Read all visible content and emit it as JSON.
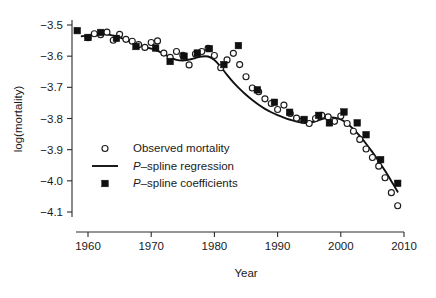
{
  "chart_data": {
    "type": "scatter",
    "title": "",
    "xlabel": "Year",
    "ylabel": "log(mortality)",
    "xlim": [
      1957.5,
      2010.5
    ],
    "ylim": [
      -4.16,
      -3.47
    ],
    "grid": false,
    "legend_position": "inside-left-lower",
    "xticks": [
      1960,
      1970,
      1980,
      1990,
      2000,
      2010
    ],
    "xticklabels": [
      "1960",
      "1970",
      "1980",
      "1990",
      "2000",
      "2010"
    ],
    "yticks": [
      -3.5,
      -3.6,
      -3.7,
      -3.8,
      -3.9,
      -4.0,
      -4.1
    ],
    "yticklabels": [
      "-3.5",
      "-3.6",
      "-3.7",
      "-3.8",
      "-3.9",
      "-4.0",
      "-4.1"
    ],
    "series": [
      {
        "name": "Observed mortality",
        "marker": "open-circle",
        "x": [
          1960,
          1961,
          1962,
          1963,
          1964,
          1965,
          1966,
          1967,
          1968,
          1969,
          1970,
          1971,
          1972,
          1973,
          1974,
          1975,
          1976,
          1977,
          1978,
          1979,
          1980,
          1981,
          1982,
          1983,
          1984,
          1985,
          1986,
          1987,
          1988,
          1989,
          1990,
          1991,
          1992,
          1993,
          1994,
          1995,
          1996,
          1997,
          1998,
          1999,
          2000,
          2001,
          2002,
          2003,
          2004,
          2005,
          2006,
          2007,
          2008,
          2009
        ],
        "y": [
          -3.541,
          -3.528,
          -3.531,
          -3.523,
          -3.549,
          -3.53,
          -3.546,
          -3.552,
          -3.563,
          -3.572,
          -3.556,
          -3.551,
          -3.59,
          -3.604,
          -3.585,
          -3.597,
          -3.628,
          -3.593,
          -3.585,
          -3.575,
          -3.598,
          -3.637,
          -3.612,
          -3.591,
          -3.627,
          -3.666,
          -3.702,
          -3.714,
          -3.737,
          -3.752,
          -3.771,
          -3.757,
          -3.784,
          -3.799,
          -3.806,
          -3.816,
          -3.8,
          -3.79,
          -3.795,
          -3.809,
          -3.792,
          -3.816,
          -3.841,
          -3.867,
          -3.898,
          -3.925,
          -3.953,
          -3.99,
          -4.038,
          -4.08
        ]
      },
      {
        "name": "P-spline coefficients",
        "marker": "filled-square",
        "x": [
          1958.3,
          1960.0,
          1962.0,
          1964.5,
          1967.6,
          1970.7,
          1973.0,
          1975.2,
          1977.3,
          1979.2,
          1981.5,
          1983.8,
          1986.8,
          1989.5,
          1991.9,
          1994.2,
          1996.5,
          1998.2,
          2000.5,
          2002.6,
          2004.0,
          2006.3,
          2009.0
        ],
        "y": [
          -3.518,
          -3.54,
          -3.524,
          -3.543,
          -3.569,
          -3.574,
          -3.617,
          -3.6,
          -3.59,
          -3.576,
          -3.627,
          -3.566,
          -3.708,
          -3.748,
          -3.78,
          -3.803,
          -3.79,
          -3.814,
          -3.779,
          -3.814,
          -3.852,
          -3.932,
          -4.008
        ]
      },
      {
        "name": "P-spline regression",
        "marker": "line",
        "x": [
          1959.0,
          1960.0,
          1961.0,
          1962.0,
          1963.0,
          1964.0,
          1965.0,
          1966.0,
          1967.0,
          1968.0,
          1969.0,
          1970.0,
          1971.0,
          1972.0,
          1973.0,
          1974.0,
          1975.0,
          1976.0,
          1977.0,
          1978.0,
          1979.0,
          1980.0,
          1981.0,
          1982.0,
          1983.0,
          1984.0,
          1985.0,
          1986.0,
          1987.0,
          1988.0,
          1989.0,
          1990.0,
          1991.0,
          1992.0,
          1993.0,
          1994.0,
          1995.0,
          1996.0,
          1997.0,
          1998.0,
          1999.0,
          2000.0,
          2001.0,
          2002.0,
          2003.0,
          2004.0,
          2005.0,
          2006.0,
          2007.0,
          2008.0,
          2009.0
        ],
        "y": [
          -3.536,
          -3.534,
          -3.531,
          -3.529,
          -3.53,
          -3.534,
          -3.54,
          -3.548,
          -3.557,
          -3.565,
          -3.571,
          -3.576,
          -3.583,
          -3.593,
          -3.604,
          -3.612,
          -3.614,
          -3.611,
          -3.606,
          -3.601,
          -3.601,
          -3.612,
          -3.634,
          -3.66,
          -3.684,
          -3.705,
          -3.724,
          -3.741,
          -3.756,
          -3.769,
          -3.78,
          -3.789,
          -3.797,
          -3.804,
          -3.81,
          -3.814,
          -3.814,
          -3.809,
          -3.802,
          -3.797,
          -3.797,
          -3.803,
          -3.816,
          -3.834,
          -3.856,
          -3.881,
          -3.908,
          -3.937,
          -3.968,
          -4.001,
          -4.035
        ]
      }
    ],
    "legend": [
      {
        "label": "Observed mortality",
        "marker": "open-circle",
        "italic_prefix": ""
      },
      {
        "label": "-spline regression",
        "marker": "line",
        "italic_prefix": "P"
      },
      {
        "label": "-spline coefficients",
        "marker": "filled-square",
        "italic_prefix": "P"
      }
    ],
    "colors": {
      "line": "#101010",
      "observed_stroke": "#1b1b1b",
      "observed_fill": "#ffffff",
      "coefficient": "#101010",
      "axis": "#2b2b2b",
      "background": "#ffffff"
    }
  }
}
